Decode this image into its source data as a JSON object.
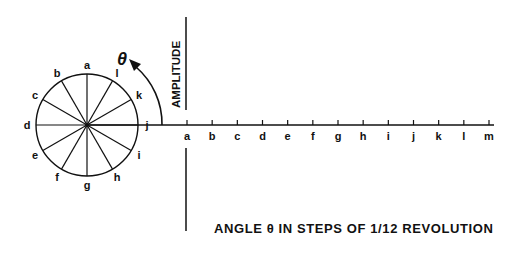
{
  "diagram": {
    "circle": {
      "cx": 87,
      "cy": 125,
      "r": 51,
      "spoke_labels": [
        "a",
        "b",
        "c",
        "d",
        "e",
        "f",
        "g",
        "h",
        "i",
        "j",
        "k",
        "l"
      ]
    },
    "theta_symbol": "θ",
    "amplitude_label": "AMPLITUDE",
    "axis": {
      "tick_labels": [
        "a",
        "b",
        "c",
        "d",
        "e",
        "f",
        "g",
        "h",
        "i",
        "j",
        "k",
        "l",
        "m"
      ],
      "caption": "ANGLE θ IN STEPS OF 1/12 REVOLUTION"
    },
    "colors": {
      "ink": "#111111",
      "background": "#ffffff"
    }
  }
}
